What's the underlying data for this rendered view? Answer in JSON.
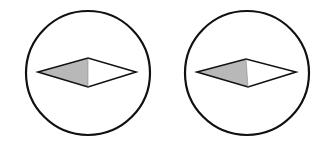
{
  "diagram": {
    "stroke_color": "#111111",
    "shade_color": "#b8b8b8",
    "fill_color": "#ffffff",
    "figures": [
      {
        "cx": 88,
        "cy": 73,
        "r": 62,
        "diamond": {
          "left": [
            38,
            72
          ],
          "top": [
            88,
            58
          ],
          "right": [
            136,
            72
          ],
          "bottom": [
            88,
            87
          ]
        }
      },
      {
        "cx": 247,
        "cy": 73,
        "r": 62,
        "diamond": {
          "left": [
            197,
            72
          ],
          "top": [
            246,
            59
          ],
          "right": [
            296,
            72
          ],
          "bottom": [
            248,
            87
          ]
        }
      }
    ]
  }
}
